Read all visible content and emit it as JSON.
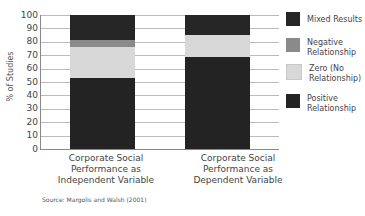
{
  "chart_data": {
    "type": "bar",
    "stacked": true,
    "title": "",
    "xlabel": "",
    "ylabel": "% of Studies",
    "ylim": [
      0,
      100
    ],
    "yticks": [
      "0",
      "10",
      "20",
      "30",
      "40",
      "50",
      "60",
      "70",
      "80",
      "90",
      "100"
    ],
    "grid": true,
    "legend_position": "right",
    "categories": [
      "Corporate Social Performance as Independent Variable",
      "Corporate Social Performance as Dependent Variable"
    ],
    "series": [
      {
        "name": "Positive Relationship",
        "values": [
          53,
          69
        ],
        "color": "#232323"
      },
      {
        "name": "Zero (No Relationship)",
        "values": [
          23,
          16
        ],
        "color": "#d8d8d8"
      },
      {
        "name": "Negative Relationship",
        "values": [
          5,
          0
        ],
        "color": "#8a8a8a"
      },
      {
        "name": "Mixed Results",
        "values": [
          19,
          15
        ],
        "color": "#262626"
      }
    ],
    "source": "Source: Margolis and Walsh (2001)"
  },
  "labels": {
    "ylabel": "% of Studies",
    "x1_l1": "Corporate Social",
    "x1_l2": "Performance as",
    "x1_l3": "Independent Variable",
    "x2_l1": "Corporate Social",
    "x2_l2": "Performance as",
    "x2_l3": "Dependent Variable",
    "source": "Source: Margolis and Walsh (2001)"
  },
  "legend": [
    {
      "l1": "Mixed Results",
      "l2": "",
      "color": "#262626"
    },
    {
      "l1": "Negative",
      "l2": "Relationship",
      "color": "#8a8a8a"
    },
    {
      "l1": "Zero (No",
      "l2": "Relationship)",
      "color": "#d8d8d8"
    },
    {
      "l1": "Positive",
      "l2": "Relationship",
      "color": "#232323"
    }
  ]
}
